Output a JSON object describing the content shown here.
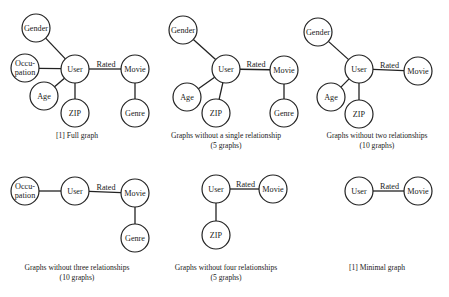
{
  "panels": [
    {
      "id": "full",
      "caption": [
        "[1] Full graph"
      ],
      "nodes": [
        {
          "id": "gender",
          "label": [
            "Gender"
          ],
          "x": 36,
          "y": 28
        },
        {
          "id": "occupation",
          "label": [
            "Occu-",
            "pation"
          ],
          "x": 25,
          "y": 68
        },
        {
          "id": "user",
          "label": [
            "User"
          ],
          "x": 75,
          "y": 69
        },
        {
          "id": "movie",
          "label": [
            "Movie"
          ],
          "x": 135,
          "y": 69
        },
        {
          "id": "age",
          "label": [
            "Age"
          ],
          "x": 44,
          "y": 96
        },
        {
          "id": "zip",
          "label": [
            "ZIP"
          ],
          "x": 75,
          "y": 113
        },
        {
          "id": "genre",
          "label": [
            "Genre"
          ],
          "x": 135,
          "y": 113
        }
      ],
      "edges": [
        [
          "gender",
          "user"
        ],
        [
          "occupation",
          "user"
        ],
        [
          "age",
          "user"
        ],
        [
          "zip",
          "user"
        ],
        [
          "user",
          "movie",
          "Rated"
        ],
        [
          "movie",
          "genre"
        ]
      ],
      "caption_pos": {
        "x": 77,
        "y": 131
      }
    },
    {
      "id": "minus-one",
      "caption": [
        "Graphs without a single relationship",
        "(5 graphs)"
      ],
      "nodes": [
        {
          "id": "gender",
          "label": [
            "Gender"
          ],
          "x": 183,
          "y": 30
        },
        {
          "id": "user",
          "label": [
            "User"
          ],
          "x": 226,
          "y": 69
        },
        {
          "id": "movie",
          "label": [
            "Movie"
          ],
          "x": 284,
          "y": 70
        },
        {
          "id": "age",
          "label": [
            "Age"
          ],
          "x": 187,
          "y": 97
        },
        {
          "id": "zip",
          "label": [
            "ZIP"
          ],
          "x": 216,
          "y": 113
        },
        {
          "id": "genre",
          "label": [
            "Genre"
          ],
          "x": 284,
          "y": 113
        }
      ],
      "edges": [
        [
          "gender",
          "user"
        ],
        [
          "age",
          "user"
        ],
        [
          "zip",
          "user"
        ],
        [
          "user",
          "movie",
          "Rated"
        ],
        [
          "movie",
          "genre"
        ]
      ],
      "caption_pos": {
        "x": 226,
        "y": 131
      }
    },
    {
      "id": "minus-two",
      "caption": [
        "Graphs without two relationships",
        "(10 graphs)"
      ],
      "nodes": [
        {
          "id": "gender",
          "label": [
            "Gender"
          ],
          "x": 318,
          "y": 32
        },
        {
          "id": "user",
          "label": [
            "User"
          ],
          "x": 359,
          "y": 69
        },
        {
          "id": "movie",
          "label": [
            "Movie"
          ],
          "x": 418,
          "y": 71
        },
        {
          "id": "age",
          "label": [
            "Age"
          ],
          "x": 331,
          "y": 97
        },
        {
          "id": "zip",
          "label": [
            "ZIP"
          ],
          "x": 359,
          "y": 114
        }
      ],
      "edges": [
        [
          "gender",
          "user"
        ],
        [
          "age",
          "user"
        ],
        [
          "zip",
          "user"
        ],
        [
          "user",
          "movie",
          "Rated"
        ]
      ],
      "caption_pos": {
        "x": 377,
        "y": 131
      }
    },
    {
      "id": "minus-three",
      "caption": [
        "Graphs without three relationships",
        "(10 graphs)"
      ],
      "nodes": [
        {
          "id": "occupation",
          "label": [
            "Occu-",
            "pation"
          ],
          "x": 25,
          "y": 191
        },
        {
          "id": "user",
          "label": [
            "User"
          ],
          "x": 75,
          "y": 191
        },
        {
          "id": "movie",
          "label": [
            "Movie"
          ],
          "x": 135,
          "y": 193
        },
        {
          "id": "genre",
          "label": [
            "Genre"
          ],
          "x": 135,
          "y": 238
        }
      ],
      "edges": [
        [
          "occupation",
          "user"
        ],
        [
          "user",
          "movie",
          "Rated"
        ],
        [
          "movie",
          "genre"
        ]
      ],
      "caption_pos": {
        "x": 77,
        "y": 263
      }
    },
    {
      "id": "minus-four",
      "caption": [
        "Graphs without four relationships",
        "(5 graphs)"
      ],
      "nodes": [
        {
          "id": "user",
          "label": [
            "User"
          ],
          "x": 216,
          "y": 189
        },
        {
          "id": "movie",
          "label": [
            "Movie"
          ],
          "x": 273,
          "y": 189
        },
        {
          "id": "zip",
          "label": [
            "ZIP"
          ],
          "x": 216,
          "y": 235
        }
      ],
      "edges": [
        [
          "user",
          "zip"
        ],
        [
          "user",
          "movie",
          "Rated"
        ]
      ],
      "caption_pos": {
        "x": 226,
        "y": 263
      }
    },
    {
      "id": "minimal",
      "caption": [
        "[1] Minimal graph"
      ],
      "nodes": [
        {
          "id": "user",
          "label": [
            "User"
          ],
          "x": 359,
          "y": 191
        },
        {
          "id": "movie",
          "label": [
            "Movie"
          ],
          "x": 418,
          "y": 191
        }
      ],
      "edges": [
        [
          "user",
          "movie",
          "Rated"
        ]
      ],
      "caption_pos": {
        "x": 377,
        "y": 263
      }
    }
  ],
  "style": {
    "node_radius": 14,
    "stroke": "#222222",
    "fill": "#ffffff"
  }
}
